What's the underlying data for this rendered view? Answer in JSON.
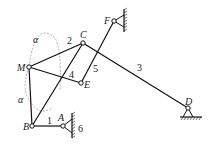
{
  "diagram": {
    "type": "linkage-mechanism",
    "points": {
      "M": "M",
      "C": "C",
      "E": "E",
      "B": "B",
      "A": "A",
      "F": "F",
      "D": "D"
    },
    "links": {
      "l1": "1",
      "l2": "2",
      "l3": "3",
      "l4": "4",
      "l5": "5",
      "l6": "6"
    },
    "angles": {
      "alpha_top": "α",
      "alpha_bottom": "α"
    },
    "colors": {
      "line": "#111111",
      "dashed": "#999999"
    }
  }
}
